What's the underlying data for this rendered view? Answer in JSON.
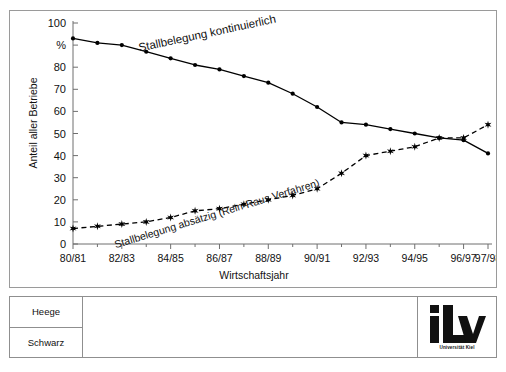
{
  "chart_data": {
    "type": "line",
    "title": "",
    "xlabel": "Wirtschaftsjahr",
    "ylabel": "Anteil aller Betriebe",
    "unit_label": "%",
    "ylim": [
      0,
      100
    ],
    "ytick_labels": [
      "0",
      "10",
      "20",
      "30",
      "40",
      "50",
      "60",
      "70",
      "80",
      "%",
      "100"
    ],
    "ytick_values": [
      0,
      10,
      20,
      30,
      40,
      50,
      60,
      70,
      80,
      90,
      100
    ],
    "grid": false,
    "legend_position": "inline-annotation",
    "x": [
      "80/81",
      "81/82",
      "82/83",
      "83/84",
      "84/85",
      "85/86",
      "86/87",
      "87/88",
      "88/89",
      "89/90",
      "90/91",
      "91/92",
      "92/93",
      "93/94",
      "94/95",
      "95/96",
      "96/97",
      "97/98"
    ],
    "xtick_labels": [
      "80/81",
      "82/83",
      "84/85",
      "86/87",
      "88/89",
      "90/91",
      "92/93",
      "94/95",
      "96/97",
      "97/98"
    ],
    "xtick_indices": [
      0,
      2,
      4,
      6,
      8,
      10,
      12,
      14,
      16,
      17
    ],
    "series": [
      {
        "name": "Stallbelegung kontinuierlich",
        "style": "solid",
        "marker": "circle",
        "color": "#000000",
        "values": [
          93,
          91,
          90,
          87,
          84,
          81,
          79,
          76,
          73,
          68,
          62,
          55,
          54,
          52,
          50,
          48,
          47,
          41
        ]
      },
      {
        "name": "Stallbelegung absätzig (Rein-Raus Verfahren)",
        "style": "dashed",
        "marker": "star",
        "color": "#000000",
        "values": [
          7,
          8,
          9,
          10,
          12,
          15,
          16,
          18,
          20,
          22,
          25,
          32,
          40,
          42,
          44,
          48,
          48,
          54
        ]
      }
    ],
    "annotations": [
      {
        "text": "Stallbelegung kontinuierlich",
        "rotation": -12
      },
      {
        "text": "Stallbelegung absätzig (Rein-Raus Verfahren)",
        "rotation": -17
      }
    ]
  },
  "footer": {
    "author_top": "Heege",
    "author_bottom": "Schwarz",
    "note": "",
    "logo": {
      "mark": "iLv",
      "subtitle": "Universität Kiel"
    }
  }
}
